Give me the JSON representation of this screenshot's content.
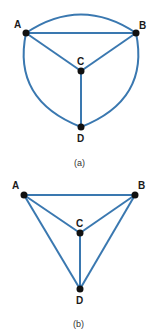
{
  "diagrams": [
    {
      "caption": "(a)",
      "nodes": [
        {
          "id": "A",
          "label": "A"
        },
        {
          "id": "B",
          "label": "B"
        },
        {
          "id": "C",
          "label": "C"
        },
        {
          "id": "D",
          "label": "D"
        }
      ],
      "edges": [
        {
          "from": "A",
          "to": "B",
          "style": "straight"
        },
        {
          "from": "A",
          "to": "B",
          "style": "curved"
        },
        {
          "from": "A",
          "to": "C",
          "style": "straight"
        },
        {
          "from": "B",
          "to": "C",
          "style": "straight"
        },
        {
          "from": "C",
          "to": "D",
          "style": "straight"
        },
        {
          "from": "A",
          "to": "D",
          "style": "curved"
        },
        {
          "from": "B",
          "to": "D",
          "style": "curved"
        }
      ]
    },
    {
      "caption": "(b)",
      "nodes": [
        {
          "id": "A",
          "label": "A"
        },
        {
          "id": "B",
          "label": "B"
        },
        {
          "id": "C",
          "label": "C"
        },
        {
          "id": "D",
          "label": "D"
        }
      ],
      "edges": [
        {
          "from": "A",
          "to": "B",
          "style": "straight"
        },
        {
          "from": "A",
          "to": "C",
          "style": "straight"
        },
        {
          "from": "B",
          "to": "C",
          "style": "straight"
        },
        {
          "from": "C",
          "to": "D",
          "style": "straight"
        },
        {
          "from": "A",
          "to": "D",
          "style": "straight"
        },
        {
          "from": "B",
          "to": "D",
          "style": "straight"
        }
      ]
    }
  ],
  "colors": {
    "edge": "#3a78b0",
    "node": "#111111"
  }
}
